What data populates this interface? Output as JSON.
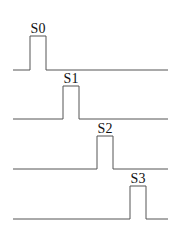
{
  "diagram": {
    "type": "timing-diagram",
    "line_color": "#555555",
    "label_color": "#111111",
    "signals": [
      {
        "label": "S0",
        "baseline_y": 70,
        "high_y": 36,
        "rise_x": 30,
        "fall_x": 46,
        "start_x": 13,
        "end_x": 168
      },
      {
        "label": "S1",
        "baseline_y": 119,
        "high_y": 86,
        "rise_x": 63,
        "fall_x": 79,
        "start_x": 13,
        "end_x": 168
      },
      {
        "label": "S2",
        "baseline_y": 169,
        "high_y": 136,
        "rise_x": 97,
        "fall_x": 113,
        "start_x": 13,
        "end_x": 168
      },
      {
        "label": "S3",
        "baseline_y": 219,
        "high_y": 186,
        "rise_x": 130,
        "fall_x": 146,
        "start_x": 13,
        "end_x": 168
      }
    ]
  }
}
